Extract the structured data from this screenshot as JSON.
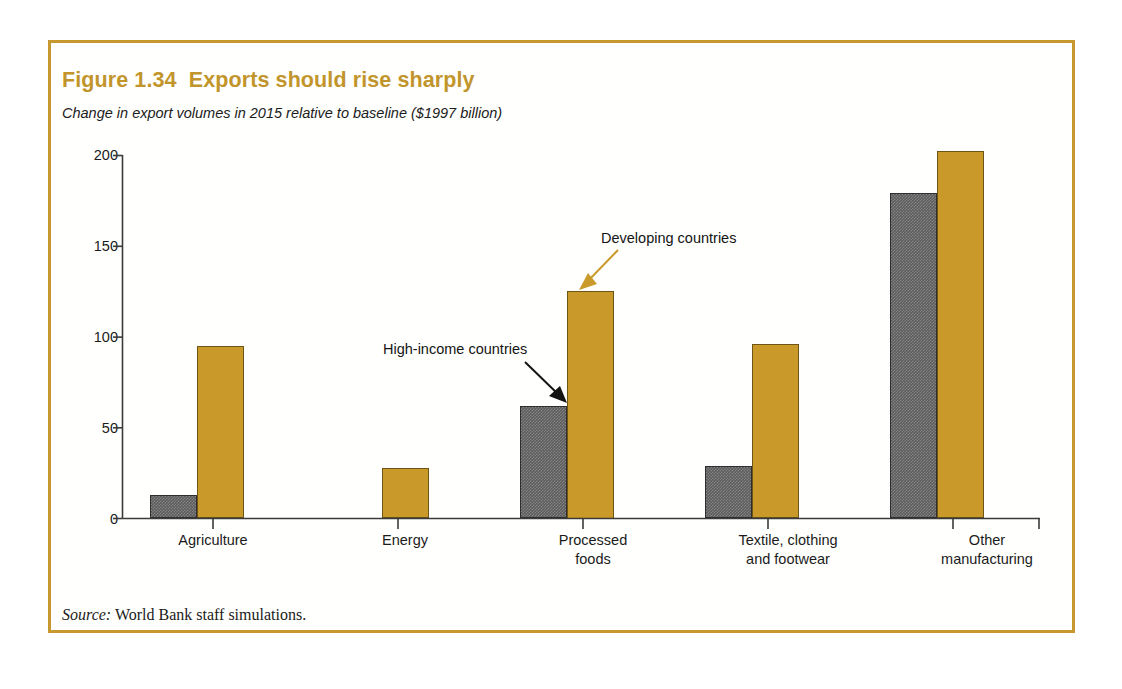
{
  "figure": {
    "title": "Figure 1.34  Exports should rise sharply",
    "subtitle": "Change in export volumes in 2015 relative to baseline ($1997 billion)",
    "source_label": "Source:",
    "source_text": " World Bank staff simulations.",
    "frame_color": "#c6982f",
    "title_color": "#c2952c"
  },
  "annotations": {
    "high_income": "High-income countries",
    "developing": "Developing countries"
  },
  "chart_data": {
    "type": "bar",
    "title": "Figure 1.34  Exports should rise sharply",
    "subtitle": "Change in export volumes in 2015 relative to baseline ($1997 billion)",
    "xlabel": "",
    "ylabel": "",
    "ylim": [
      0,
      200
    ],
    "yticks": [
      0,
      50,
      100,
      150,
      200
    ],
    "ytick_labels": [
      "0",
      "50",
      "100",
      "150",
      "200"
    ],
    "grid": false,
    "legend_position": "annotated-arrows",
    "categories": [
      "Agriculture",
      "Energy",
      "Processed\nfoods",
      "Textile, clothing\nand footwear",
      "Other\nmanufacturing"
    ],
    "series": [
      {
        "name": "High-income countries",
        "color": "#5c5c5c",
        "values": [
          13,
          0,
          62,
          29,
          179
        ]
      },
      {
        "name": "Developing countries",
        "color": "#c9992a",
        "values": [
          95,
          28,
          125,
          96,
          202
        ]
      }
    ],
    "source": "World Bank staff simulations."
  }
}
